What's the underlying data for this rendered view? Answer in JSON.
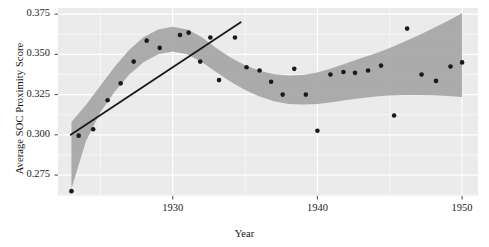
{
  "chart_data": {
    "type": "scatter",
    "title": "",
    "xlabel": "Year",
    "ylabel": "Average SOC Proximity Score",
    "xlim": [
      1922.07,
      1951.1
    ],
    "ylim": [
      0.262,
      0.3788
    ],
    "xticks": [
      1930,
      1940,
      1950
    ],
    "xticklabels": [
      "1930",
      "1940",
      "1950"
    ],
    "yticks": [
      0.275,
      0.3,
      0.325,
      0.35,
      0.375
    ],
    "yticklabels": [
      "0.275",
      "0.300",
      "0.325",
      "0.350",
      "0.375"
    ],
    "grid": true,
    "grid_color": "#ffffff",
    "panel_bg": "#ebebeb",
    "legend": "none",
    "point_color": "#1a1a1a",
    "ribbon_color": "#a8a8a8",
    "trendline_color": "#1a1a1a",
    "series": [
      {
        "name": "Average SOC Proximity Score",
        "type": "scatter",
        "points": [
          {
            "x": 1923.0,
            "y": 0.265
          },
          {
            "x": 1923.5,
            "y": 0.2995
          },
          {
            "x": 1924.5,
            "y": 0.3035
          },
          {
            "x": 1925.5,
            "y": 0.3215
          },
          {
            "x": 1926.4,
            "y": 0.332
          },
          {
            "x": 1927.3,
            "y": 0.3455
          },
          {
            "x": 1928.2,
            "y": 0.3585
          },
          {
            "x": 1929.1,
            "y": 0.354
          },
          {
            "x": 1930.5,
            "y": 0.362
          },
          {
            "x": 1931.1,
            "y": 0.3635
          },
          {
            "x": 1931.9,
            "y": 0.3455
          },
          {
            "x": 1932.6,
            "y": 0.3605
          },
          {
            "x": 1933.2,
            "y": 0.334
          },
          {
            "x": 1934.3,
            "y": 0.3605
          },
          {
            "x": 1935.1,
            "y": 0.342
          },
          {
            "x": 1936.0,
            "y": 0.34
          },
          {
            "x": 1936.8,
            "y": 0.333
          },
          {
            "x": 1937.6,
            "y": 0.325
          },
          {
            "x": 1938.4,
            "y": 0.341
          },
          {
            "x": 1939.2,
            "y": 0.325
          },
          {
            "x": 1940.0,
            "y": 0.3025
          },
          {
            "x": 1940.9,
            "y": 0.3375
          },
          {
            "x": 1941.8,
            "y": 0.339
          },
          {
            "x": 1942.6,
            "y": 0.3385
          },
          {
            "x": 1943.5,
            "y": 0.34
          },
          {
            "x": 1944.4,
            "y": 0.343
          },
          {
            "x": 1945.3,
            "y": 0.312
          },
          {
            "x": 1946.2,
            "y": 0.366
          },
          {
            "x": 1947.2,
            "y": 0.3375
          },
          {
            "x": 1948.2,
            "y": 0.3335
          },
          {
            "x": 1949.2,
            "y": 0.3425
          },
          {
            "x": 1950.0,
            "y": 0.345
          }
        ]
      },
      {
        "name": "LOESS smooth",
        "type": "line",
        "points": [
          {
            "x": 1923.0,
            "y": 0.287
          },
          {
            "x": 1924.0,
            "y": 0.307
          },
          {
            "x": 1925.0,
            "y": 0.322
          },
          {
            "x": 1926.0,
            "y": 0.3345
          },
          {
            "x": 1927.0,
            "y": 0.345
          },
          {
            "x": 1928.0,
            "y": 0.353
          },
          {
            "x": 1929.0,
            "y": 0.3578
          },
          {
            "x": 1930.0,
            "y": 0.3595
          },
          {
            "x": 1931.0,
            "y": 0.3578
          },
          {
            "x": 1932.0,
            "y": 0.353
          },
          {
            "x": 1933.0,
            "y": 0.3465
          },
          {
            "x": 1934.0,
            "y": 0.3405
          },
          {
            "x": 1935.0,
            "y": 0.3355
          },
          {
            "x": 1936.0,
            "y": 0.3318
          },
          {
            "x": 1937.0,
            "y": 0.3292
          },
          {
            "x": 1938.0,
            "y": 0.328
          },
          {
            "x": 1939.0,
            "y": 0.328
          },
          {
            "x": 1940.0,
            "y": 0.329
          },
          {
            "x": 1941.0,
            "y": 0.3308
          },
          {
            "x": 1942.0,
            "y": 0.333
          },
          {
            "x": 1943.0,
            "y": 0.3352
          },
          {
            "x": 1944.0,
            "y": 0.3372
          },
          {
            "x": 1945.0,
            "y": 0.3392
          },
          {
            "x": 1946.0,
            "y": 0.3412
          },
          {
            "x": 1947.0,
            "y": 0.343
          },
          {
            "x": 1948.0,
            "y": 0.3448
          },
          {
            "x": 1949.0,
            "y": 0.3465
          },
          {
            "x": 1950.0,
            "y": 0.348
          }
        ],
        "band": [
          {
            "x": 1923.0,
            "lo": 0.2665,
            "hi": 0.308
          },
          {
            "x": 1924.0,
            "lo": 0.296,
            "hi": 0.3185
          },
          {
            "x": 1925.0,
            "lo": 0.314,
            "hi": 0.3305
          },
          {
            "x": 1926.0,
            "lo": 0.327,
            "hi": 0.3425
          },
          {
            "x": 1927.0,
            "lo": 0.3375,
            "hi": 0.3528
          },
          {
            "x": 1928.0,
            "lo": 0.3452,
            "hi": 0.3608
          },
          {
            "x": 1929.0,
            "lo": 0.35,
            "hi": 0.3655
          },
          {
            "x": 1930.0,
            "lo": 0.3518,
            "hi": 0.3672
          },
          {
            "x": 1931.0,
            "lo": 0.35,
            "hi": 0.3655
          },
          {
            "x": 1932.0,
            "lo": 0.3452,
            "hi": 0.3608
          },
          {
            "x": 1933.0,
            "lo": 0.339,
            "hi": 0.354
          },
          {
            "x": 1934.0,
            "lo": 0.333,
            "hi": 0.348
          },
          {
            "x": 1935.0,
            "lo": 0.3278,
            "hi": 0.3432
          },
          {
            "x": 1936.0,
            "lo": 0.3238,
            "hi": 0.3398
          },
          {
            "x": 1937.0,
            "lo": 0.3208,
            "hi": 0.3376
          },
          {
            "x": 1938.0,
            "lo": 0.3192,
            "hi": 0.3368
          },
          {
            "x": 1939.0,
            "lo": 0.3188,
            "hi": 0.3372
          },
          {
            "x": 1940.0,
            "lo": 0.3192,
            "hi": 0.3388
          },
          {
            "x": 1941.0,
            "lo": 0.3202,
            "hi": 0.3414
          },
          {
            "x": 1942.0,
            "lo": 0.3216,
            "hi": 0.3444
          },
          {
            "x": 1943.0,
            "lo": 0.3228,
            "hi": 0.3476
          },
          {
            "x": 1944.0,
            "lo": 0.3238,
            "hi": 0.3506
          },
          {
            "x": 1945.0,
            "lo": 0.3244,
            "hi": 0.354
          },
          {
            "x": 1946.0,
            "lo": 0.3248,
            "hi": 0.3578
          },
          {
            "x": 1947.0,
            "lo": 0.3248,
            "hi": 0.3618
          },
          {
            "x": 1948.0,
            "lo": 0.3246,
            "hi": 0.3662
          },
          {
            "x": 1949.0,
            "lo": 0.3242,
            "hi": 0.3708
          },
          {
            "x": 1950.0,
            "lo": 0.3235,
            "hi": 0.3755
          }
        ]
      },
      {
        "name": "Linear trend",
        "type": "line",
        "points": [
          {
            "x": 1922.95,
            "y": 0.3
          },
          {
            "x": 1934.7,
            "y": 0.37
          }
        ]
      }
    ]
  }
}
